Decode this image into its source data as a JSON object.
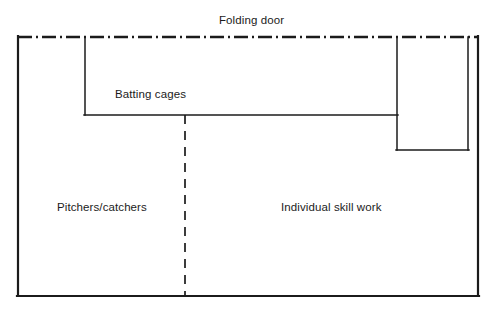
{
  "diagram": {
    "type": "facility-floor-plan",
    "background_color": "#ffffff",
    "line_color": "#1b1b1b",
    "text_color": "#1b1b1b",
    "canvas": {
      "width": 499,
      "height": 310
    },
    "labels": {
      "folding_door": "Folding door",
      "batting_cages": "Batting cages",
      "pitchers_catchers": "Pitchers/catchers",
      "individual_skill_work": "Individual skill work"
    },
    "zones": [
      {
        "id": "batting-cages",
        "name": "Batting cages",
        "bounds": {
          "x": 85,
          "y": 37,
          "width": 312,
          "height": 78
        },
        "notes": "Upper long bay running along the folding-door wall"
      },
      {
        "id": "pitchers-catchers",
        "name": "Pitchers/catchers",
        "bounds": {
          "x": 18,
          "y": 115,
          "width": 167,
          "height": 181
        },
        "notes": "Lower-left area, divided from skill work by a dashed net line"
      },
      {
        "id": "individual-skill-work",
        "name": "Individual skill work",
        "bounds": {
          "x": 185,
          "y": 115,
          "width": 293,
          "height": 181
        },
        "notes": "Lower-right open area"
      },
      {
        "id": "right-bay",
        "name": "Right bay",
        "bounds": {
          "x": 397,
          "y": 37,
          "width": 71,
          "height": 113
        },
        "notes": "Narrow vertical room at the upper right"
      }
    ],
    "walls": [
      {
        "id": "outer-left-wall",
        "kind": "solid",
        "x1": 18,
        "y1": 37,
        "x2": 18,
        "y2": 296
      },
      {
        "id": "outer-bottom-wall",
        "kind": "solid",
        "x1": 18,
        "y1": 296,
        "x2": 478,
        "y2": 296
      },
      {
        "id": "outer-right-wall",
        "kind": "solid",
        "x1": 478,
        "y1": 37,
        "x2": 478,
        "y2": 296
      },
      {
        "id": "folding-door-wall",
        "kind": "dash-dot",
        "x1": 18,
        "y1": 37,
        "x2": 478,
        "y2": 37
      },
      {
        "id": "cage-left-wall",
        "kind": "solid",
        "x1": 85,
        "y1": 37,
        "x2": 85,
        "y2": 115
      },
      {
        "id": "cage-bottom-wall",
        "kind": "solid",
        "x1": 85,
        "y1": 115,
        "x2": 397,
        "y2": 115
      },
      {
        "id": "right-bay-left-wall",
        "kind": "solid",
        "x1": 397,
        "y1": 37,
        "x2": 397,
        "y2": 150
      },
      {
        "id": "right-bay-bottom-wall",
        "kind": "solid",
        "x1": 397,
        "y1": 150,
        "x2": 468,
        "y2": 150
      },
      {
        "id": "right-bay-right-wall",
        "kind": "solid",
        "x1": 468,
        "y1": 37,
        "x2": 468,
        "y2": 150
      },
      {
        "id": "net-divider",
        "kind": "dashed",
        "x1": 185,
        "y1": 115,
        "x2": 185,
        "y2": 296
      }
    ],
    "legend_keys": [
      {
        "kind": "dash-dot",
        "meaning": "Folding door"
      },
      {
        "kind": "dashed",
        "meaning": "Net divider"
      },
      {
        "kind": "solid",
        "meaning": "Wall"
      }
    ]
  }
}
